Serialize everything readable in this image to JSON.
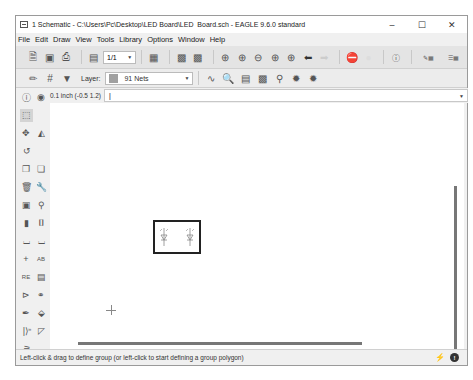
{
  "window": {
    "title": "1 Schematic - C:\\Users\\Pc\\Desktop\\LED Board\\LED_Board.sch - EAGLE 9.6.0 standard",
    "controls": {
      "minimize": "–",
      "maximize": "☐",
      "close": "✕"
    }
  },
  "menu": [
    "File",
    "Edit",
    "Draw",
    "View",
    "Tools",
    "Library",
    "Options",
    "Window",
    "Help"
  ],
  "toolbar": {
    "sheet_select": "1/1",
    "icons": [
      "open-icon",
      "save-icon",
      "print-icon",
      "sheet-icon",
      "cam-icon",
      "sch-icon",
      "brd-icon",
      "zoom-fit-icon",
      "zoom-in-icon",
      "zoom-out-icon",
      "zoom-select-icon",
      "zoom-redraw-icon",
      "undo-icon",
      "redo-icon",
      "stop-icon",
      "go-icon",
      "help-icon",
      "design-link-icon",
      "pcb-quote-icon"
    ]
  },
  "toolbar2": {
    "layer_label": "Layer:",
    "layer_value": "91 Nets",
    "layer_color": "#a0a0a0"
  },
  "command": {
    "coordinates": "0.1 inch (-0.5 1.2)",
    "value": "|"
  },
  "sidebar": {
    "tools": [
      "info",
      "show",
      "group",
      "move",
      "mirror",
      "rotate",
      "copy",
      "paste",
      "delete",
      "replace",
      "add",
      "change",
      "split",
      "gate-swap",
      "wire",
      "net",
      "junction",
      "label",
      "erc",
      "name",
      "invoke",
      "value",
      "pinswap",
      "smash",
      "text",
      "attribute",
      "mark"
    ],
    "expand": "»"
  },
  "canvas": {
    "group_box": {
      "border_color": "#222222"
    }
  },
  "status": {
    "message": "Left-click & drag to define group (or left-click to start defining a group polygon)"
  }
}
